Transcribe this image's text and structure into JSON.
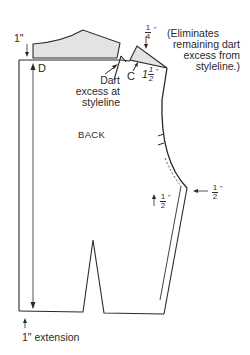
{
  "diagram": {
    "title": "BACK",
    "labels": {
      "top_left_measure": "1\"",
      "point_d": "D",
      "point_c": "C",
      "dart_note": [
        "Dart",
        "excess at",
        "styleline"
      ],
      "quarter_measure_num": "1",
      "quarter_measure_den": "4",
      "quarter_measure_unit": "\"",
      "eliminates_note": [
        "(Eliminates",
        "remaining dart",
        "excess from",
        "styleline.)"
      ],
      "one_half_measure_whole": "1",
      "one_half_measure_num": "1",
      "one_half_measure_den": "2",
      "one_half_measure_unit": "\"",
      "side_half_left_num": "1",
      "side_half_left_den": "2",
      "side_half_right_num": "1",
      "side_half_right_den": "2",
      "inch_mark": "\"",
      "bottom_note": "1\" extension"
    },
    "colors": {
      "line": "#2a2a2a",
      "shade": "#e3e3e3"
    }
  }
}
